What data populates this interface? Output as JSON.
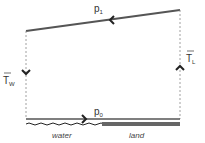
{
  "diagram": {
    "type": "sea-breeze-circulation",
    "labels": {
      "top_pressure": "p",
      "top_pressure_sub": "1",
      "bottom_pressure": "p",
      "bottom_pressure_sub": "0",
      "temp_water": "T",
      "temp_water_sub": "W",
      "temp_land": "T",
      "temp_land_sub": "L",
      "surface_water": "water",
      "surface_land": "land"
    },
    "colors": {
      "line": "#555555",
      "dashed": "#888888",
      "land": "#666666",
      "text": "#333333"
    }
  }
}
